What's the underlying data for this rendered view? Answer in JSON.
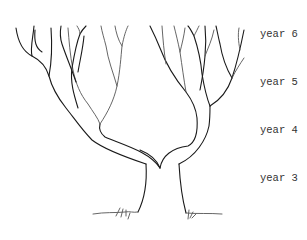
{
  "figure": {
    "type": "tree growth diagram",
    "labels": [
      {
        "text": "year 6",
        "y": 28
      },
      {
        "text": "year 5",
        "y": 76
      },
      {
        "text": "year 4",
        "y": 124
      },
      {
        "text": "year 3",
        "y": 172
      }
    ],
    "colors": {
      "line": "#1a1a1a",
      "label": "#333333",
      "background": "#ffffff"
    }
  }
}
